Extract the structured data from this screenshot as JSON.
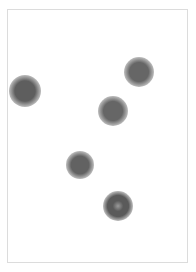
{
  "canvas": {
    "width": 196,
    "height": 272,
    "background": "#ffffff"
  },
  "frame": {
    "left": 7,
    "top": 9,
    "width": 181,
    "height": 254,
    "border_color": "#dcdcdc"
  },
  "dots": [
    {
      "cx": 25,
      "cy": 91,
      "r": 13,
      "color": "#5e5e5e",
      "style": "solid"
    },
    {
      "cx": 139,
      "cy": 72,
      "r": 12,
      "color": "#666666",
      "style": "solid"
    },
    {
      "cx": 113,
      "cy": 111,
      "r": 12,
      "color": "#666666",
      "style": "solid"
    },
    {
      "cx": 80,
      "cy": 165,
      "r": 11,
      "color": "#626262",
      "style": "solid"
    },
    {
      "cx": 118,
      "cy": 206,
      "r": 12,
      "color": "#5a5a5a",
      "style": "ring"
    }
  ]
}
